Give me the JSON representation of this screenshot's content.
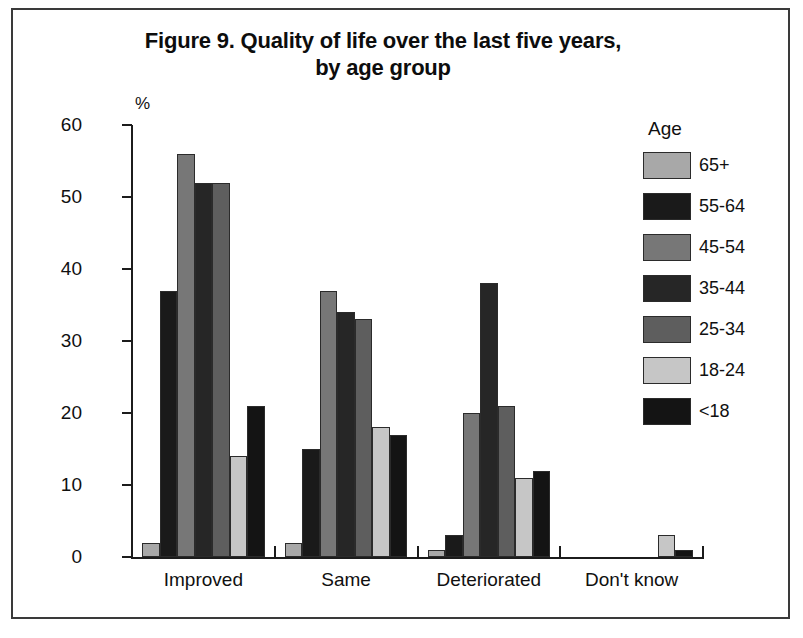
{
  "figure": {
    "title_line1": "Figure 9. Quality of life over the last five years,",
    "title_line2": "by age group",
    "axis_unit_label": "%"
  },
  "legend": {
    "title": "Age",
    "entries": [
      {
        "label": "65+",
        "color": "#a8a8a8"
      },
      {
        "label": "55-64",
        "color": "#1a1a1a"
      },
      {
        "label": "45-54",
        "color": "#777777"
      },
      {
        "label": "35-44",
        "color": "#262626"
      },
      {
        "label": "25-34",
        "color": "#5e5e5e"
      },
      {
        "label": "18-24",
        "color": "#c6c6c6"
      },
      {
        "label": "<18",
        "color": "#141414"
      }
    ]
  },
  "chart_data": {
    "type": "bar",
    "title": "Figure 9. Quality of life over the last five years, by age group",
    "xlabel": "",
    "ylabel": "%",
    "ylim": [
      0,
      60
    ],
    "yticks": [
      0,
      10,
      20,
      30,
      40,
      50,
      60
    ],
    "grid": false,
    "legend_position": "right",
    "legend_title": "Age",
    "categories": [
      "Improved",
      "Same",
      "Deteriorated",
      "Don't know"
    ],
    "series": [
      {
        "name": "65+",
        "color": "#a8a8a8",
        "values": [
          2,
          2,
          1,
          0
        ]
      },
      {
        "name": "55-64",
        "color": "#1a1a1a",
        "values": [
          37,
          15,
          3,
          0
        ]
      },
      {
        "name": "45-54",
        "color": "#777777",
        "values": [
          56,
          37,
          20,
          0
        ]
      },
      {
        "name": "35-44",
        "color": "#262626",
        "values": [
          52,
          34,
          38,
          0
        ]
      },
      {
        "name": "25-34",
        "color": "#5e5e5e",
        "values": [
          52,
          33,
          21,
          0
        ]
      },
      {
        "name": "18-24",
        "color": "#c6c6c6",
        "values": [
          14,
          18,
          11,
          3
        ]
      },
      {
        "name": "<18",
        "color": "#141414",
        "values": [
          21,
          17,
          12,
          1
        ]
      }
    ]
  }
}
